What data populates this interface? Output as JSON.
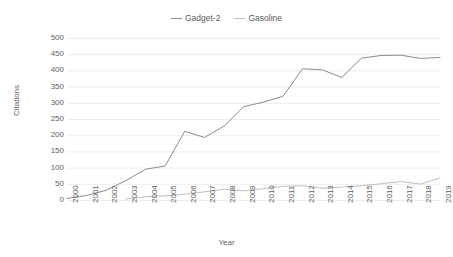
{
  "chart_data": {
    "type": "line",
    "title": "",
    "xlabel": "Year",
    "ylabel": "Citations",
    "xlim": [
      2000,
      2019
    ],
    "ylim": [
      0,
      500
    ],
    "ytick_step": 50,
    "yticks": [
      500,
      450,
      400,
      350,
      300,
      250,
      200,
      150,
      100,
      50,
      0
    ],
    "grid": true,
    "grid_axis": "y",
    "legend_position": "top-center",
    "categories": [
      "2000",
      "2001",
      "2002",
      "2003",
      "2004",
      "2005",
      "2006",
      "2007",
      "2008",
      "2009",
      "2010",
      "2011",
      "2012",
      "2013",
      "2014",
      "2015",
      "2016",
      "2017",
      "2018",
      "2019"
    ],
    "x": [
      2000,
      2001,
      2002,
      2003,
      2004,
      2005,
      2006,
      2007,
      2008,
      2009,
      2010,
      2011,
      2012,
      2013,
      2014,
      2015,
      2016,
      2017,
      2018,
      2019
    ],
    "series": [
      {
        "name": "Gadget-2",
        "color": "#8c8c8c",
        "values": [
          5,
          14,
          30,
          60,
          95,
          105,
          212,
          193,
          228,
          288,
          302,
          320,
          405,
          402,
          378,
          438,
          446,
          447,
          437,
          440
        ]
      },
      {
        "name": "Gasoline",
        "color": "#bfbfbf",
        "values": [
          null,
          null,
          null,
          3,
          10,
          13,
          18,
          25,
          33,
          28,
          35,
          42,
          44,
          36,
          40,
          44,
          50,
          57,
          49,
          68
        ]
      }
    ]
  },
  "legend": {
    "items": [
      {
        "label": "Gadget-2",
        "color": "#8c8c8c"
      },
      {
        "label": "Gasoline",
        "color": "#bfbfbf"
      }
    ]
  },
  "axes": {
    "y": {
      "title": "Citations",
      "ticks": [
        "500",
        "450",
        "400",
        "350",
        "300",
        "250",
        "200",
        "150",
        "100",
        "50",
        "0"
      ]
    },
    "x": {
      "title": "Year",
      "ticks": [
        "2000",
        "2001",
        "2002",
        "2003",
        "2004",
        "2005",
        "2006",
        "2007",
        "2008",
        "2009",
        "2010",
        "2011",
        "2012",
        "2013",
        "2014",
        "2015",
        "2016",
        "2017",
        "2018",
        "2019"
      ]
    }
  }
}
